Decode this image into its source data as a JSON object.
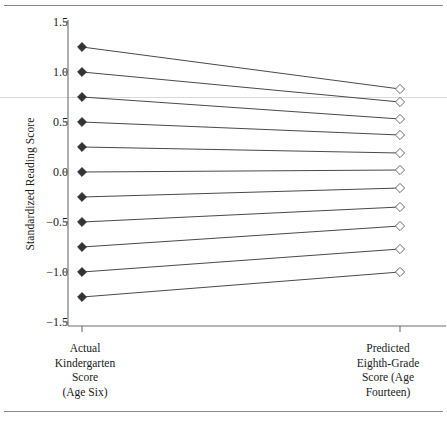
{
  "figure": {
    "background_color": "#ffffff",
    "line_color": "#4a4a4a",
    "axis_color": "#6e6e6e",
    "text_color": "#1a1a1a",
    "hairline_color": "#d9d9d9",
    "rule_color": "#8a8a8a"
  },
  "chart_data": {
    "type": "line",
    "title": "",
    "subtitle": "",
    "xlabel": "",
    "ylabel": "Standardized Reading Score",
    "categories": [
      "Actual Kindergarten Score (Age Six)",
      "Predicted Eighth-Grade Score (Age Fourteen)"
    ],
    "category_lines": [
      [
        "Actual",
        "Kindergarten",
        "Score",
        "(Age Six)"
      ],
      [
        "Predicted",
        "Eighth-Grade",
        "Score (Age",
        "Fourteen)"
      ]
    ],
    "x": [
      0,
      1
    ],
    "ylim": [
      -1.5,
      1.5
    ],
    "yticks": [
      1.5,
      1.0,
      0.5,
      0.0,
      -0.5,
      -1.0,
      -1.5
    ],
    "ytick_labels": [
      "1.5",
      "1.0",
      "0.5",
      "0.0",
      "−0.5",
      "−1.0",
      "−1.5"
    ],
    "grid": false,
    "legend": false,
    "legend_position": "none",
    "marker_start": "filled-diamond",
    "marker_end": "open-diamond",
    "annotations": [
      {
        "name": "page-hairline",
        "type": "horizontal-rule",
        "y": 0.75
      }
    ],
    "series": [
      {
        "name": "line-1",
        "values": [
          1.25,
          0.83
        ]
      },
      {
        "name": "line-2",
        "values": [
          1.0,
          0.7
        ]
      },
      {
        "name": "line-3",
        "values": [
          0.75,
          0.53
        ]
      },
      {
        "name": "line-4",
        "values": [
          0.5,
          0.37
        ]
      },
      {
        "name": "line-5",
        "values": [
          0.25,
          0.19
        ]
      },
      {
        "name": "line-6",
        "values": [
          0.0,
          0.02
        ]
      },
      {
        "name": "line-7",
        "values": [
          -0.25,
          -0.16
        ]
      },
      {
        "name": "line-8",
        "values": [
          -0.5,
          -0.35
        ]
      },
      {
        "name": "line-9",
        "values": [
          -0.75,
          -0.54
        ]
      },
      {
        "name": "line-10",
        "values": [
          -1.0,
          -0.77
        ]
      },
      {
        "name": "line-11",
        "values": [
          -1.25,
          -1.0
        ]
      }
    ]
  }
}
